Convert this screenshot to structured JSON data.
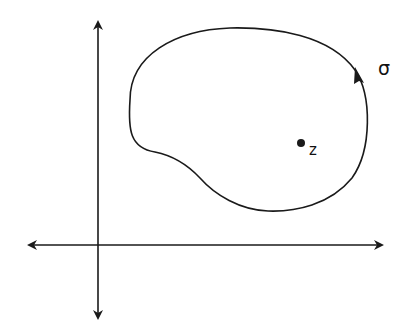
{
  "diagram": {
    "labels": {
      "curve": "σ",
      "point": "z"
    },
    "colors": {
      "stroke": "#1a1a1a",
      "background": "#ffffff"
    },
    "axes": {
      "vertical": {
        "x": 98,
        "y_top": 20,
        "y_bottom": 320
      },
      "horizontal": {
        "y": 245,
        "x_left": 27,
        "x_right": 383
      }
    },
    "point_z": {
      "x": 301,
      "y": 143
    },
    "curve_direction": "counterclockwise"
  }
}
